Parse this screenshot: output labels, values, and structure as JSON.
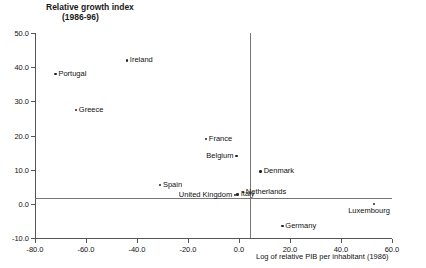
{
  "chart_data": {
    "type": "scatter",
    "title": "Relative growth index (1986-96)",
    "title_line1": "Relative growth index",
    "title_line2": "(1986-96)",
    "xlabel": "Log of relative PIB per inhabitant (1986)",
    "ylabel": "Relative growth index (1986-96)",
    "xlim": [
      -80.0,
      60.0
    ],
    "ylim": [
      -10.0,
      50.0
    ],
    "xticks": [
      "-80.0",
      "-60.0",
      "-40.0",
      "-20.0",
      "0.0",
      "20.0",
      "40.0",
      "60.0"
    ],
    "yticks": [
      "50.0",
      "40.0",
      "30.0",
      "20.0",
      "10.0",
      "0.0",
      "-10.0"
    ],
    "grid": false,
    "legend": "none",
    "marker_color": "#222222",
    "axis_color": "#555555",
    "points": [
      {
        "label": "Portugal",
        "x": -72.0,
        "y": 38.0,
        "label_side": "right"
      },
      {
        "label": "Ireland",
        "x": -44.0,
        "y": 42.0,
        "label_side": "right"
      },
      {
        "label": "Greece",
        "x": -64.0,
        "y": 27.5,
        "label_side": "right"
      },
      {
        "label": "France",
        "x": -13.0,
        "y": 19.0,
        "label_side": "right"
      },
      {
        "label": "Belgium",
        "x": -1.0,
        "y": 14.0,
        "label_side": "left"
      },
      {
        "label": "Spain",
        "x": -31.0,
        "y": 5.5,
        "label_side": "right"
      },
      {
        "label": "Denmark",
        "x": 8.5,
        "y": 9.5,
        "label_side": "right"
      },
      {
        "label": "Netherlands",
        "x": 1.5,
        "y": 3.5,
        "label_side": "right"
      },
      {
        "label": "Italy",
        "x": -0.5,
        "y": 2.8,
        "label_side": "right"
      },
      {
        "label": "United Kingdom",
        "x": -1.5,
        "y": 2.6,
        "label_side": "left"
      },
      {
        "label": "Luxembourg",
        "x": 53.0,
        "y": 0.0,
        "label_side": "below"
      },
      {
        "label": "Germany",
        "x": 17.0,
        "y": -6.5,
        "label_side": "right"
      }
    ]
  }
}
